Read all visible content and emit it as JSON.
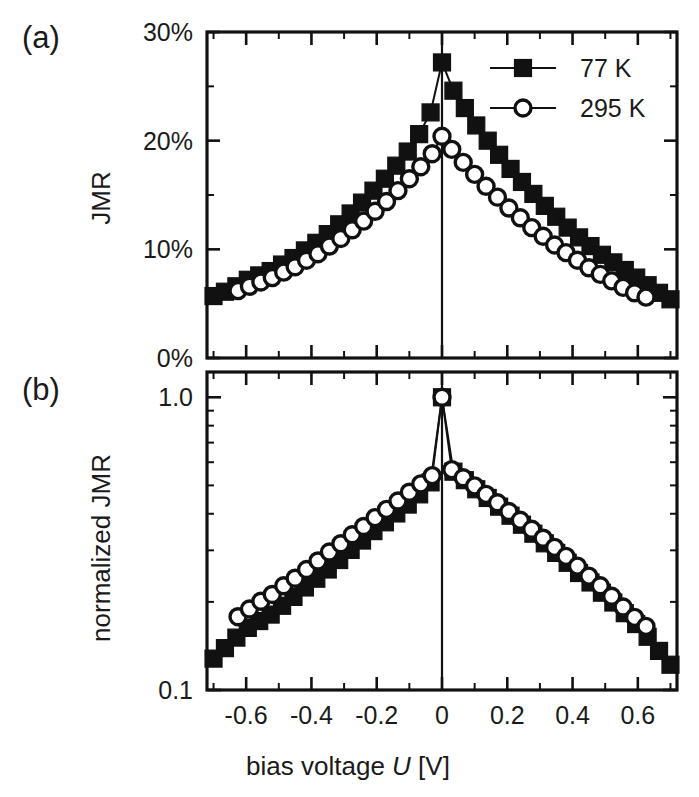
{
  "figure": {
    "panel_a_label": "(a)",
    "panel_b_label": "(b)",
    "xlabel_main": "bias voltage",
    "xlabel_symbol": "U",
    "xlabel_unit": "[V]",
    "ink_color": "#111111",
    "background_color": "#ffffff"
  },
  "legend": {
    "entries": [
      {
        "label": "77 K",
        "marker": "filled-square"
      },
      {
        "label": "295 K",
        "marker": "open-circle"
      }
    ]
  },
  "chart_data": [
    {
      "type": "line",
      "panel": "a",
      "title": "",
      "xlabel": "bias voltage U [V]",
      "ylabel": "JMR",
      "yscale": "linear",
      "xlim": [
        -0.72,
        0.72
      ],
      "ylim": [
        0,
        30
      ],
      "xticks": [
        -0.6,
        -0.4,
        -0.2,
        0,
        0.2,
        0.4,
        0.6
      ],
      "xticklabels": [
        "-0.6",
        "-0.4",
        "-0.2",
        "0",
        "0.2",
        "0.4",
        "0.6"
      ],
      "xminor_step": 0.1,
      "yticks": [
        0,
        10,
        20,
        30
      ],
      "yticklabels": [
        "0%",
        "10%",
        "20%",
        "30%"
      ],
      "yminor_step": 5,
      "grid": false,
      "legend_position": "top-right",
      "zero_line": true,
      "series": [
        {
          "name": "77 K",
          "marker": "filled-square",
          "x": [
            -0.7,
            -0.665,
            -0.63,
            -0.595,
            -0.56,
            -0.525,
            -0.49,
            -0.455,
            -0.42,
            -0.385,
            -0.35,
            -0.315,
            -0.28,
            -0.245,
            -0.21,
            -0.175,
            -0.14,
            -0.105,
            -0.07,
            -0.035,
            0.0,
            0.035,
            0.07,
            0.105,
            0.14,
            0.175,
            0.21,
            0.245,
            0.28,
            0.315,
            0.35,
            0.385,
            0.42,
            0.455,
            0.49,
            0.525,
            0.56,
            0.595,
            0.63,
            0.665,
            0.7
          ],
          "y": [
            5.7,
            6.1,
            6.6,
            7.2,
            7.6,
            8.0,
            8.6,
            9.2,
            9.9,
            10.6,
            11.4,
            12.3,
            13.3,
            14.3,
            15.4,
            16.5,
            17.7,
            19.0,
            20.6,
            22.6,
            27.2,
            24.6,
            23.0,
            21.4,
            20.0,
            18.7,
            17.4,
            16.2,
            15.1,
            14.0,
            13.0,
            12.0,
            11.1,
            10.3,
            9.5,
            8.8,
            8.1,
            7.4,
            6.7,
            6.0,
            5.4
          ]
        },
        {
          "name": "295 K",
          "marker": "open-circle",
          "x": [
            -0.625,
            -0.59,
            -0.555,
            -0.52,
            -0.485,
            -0.45,
            -0.415,
            -0.38,
            -0.345,
            -0.31,
            -0.275,
            -0.24,
            -0.205,
            -0.17,
            -0.135,
            -0.1,
            -0.065,
            -0.03,
            0.0,
            0.03,
            0.065,
            0.1,
            0.135,
            0.17,
            0.205,
            0.24,
            0.275,
            0.31,
            0.345,
            0.38,
            0.415,
            0.45,
            0.485,
            0.52,
            0.555,
            0.59,
            0.625
          ],
          "y": [
            6.2,
            6.6,
            7.0,
            7.4,
            7.9,
            8.4,
            9.0,
            9.6,
            10.3,
            11.0,
            11.8,
            12.6,
            13.5,
            14.4,
            15.4,
            16.5,
            17.6,
            18.8,
            20.4,
            19.2,
            18.0,
            16.9,
            15.8,
            14.8,
            13.8,
            12.9,
            12.0,
            11.2,
            10.4,
            9.7,
            9.0,
            8.3,
            7.7,
            7.1,
            6.5,
            6.0,
            5.6
          ]
        }
      ]
    },
    {
      "type": "line",
      "panel": "b",
      "title": "",
      "xlabel": "bias voltage U [V]",
      "ylabel": "normalized JMR",
      "yscale": "log",
      "xlim": [
        -0.72,
        0.72
      ],
      "ylim": [
        0.1,
        1.22
      ],
      "xticks": [
        -0.6,
        -0.4,
        -0.2,
        0,
        0.2,
        0.4,
        0.6
      ],
      "xticklabels": [
        "-0.6",
        "-0.4",
        "-0.2",
        "0",
        "0.2",
        "0.4",
        "0.6"
      ],
      "xminor_step": 0.1,
      "yticks": [
        0.1,
        1.0
      ],
      "yticklabels": [
        "0.1",
        "1.0"
      ],
      "grid": false,
      "legend_position": "none",
      "zero_line": true,
      "series": [
        {
          "name": "77 K",
          "marker": "filled-square",
          "x": [
            -0.7,
            -0.665,
            -0.63,
            -0.595,
            -0.56,
            -0.525,
            -0.49,
            -0.455,
            -0.42,
            -0.385,
            -0.35,
            -0.315,
            -0.28,
            -0.245,
            -0.21,
            -0.175,
            -0.14,
            -0.105,
            -0.07,
            -0.035,
            0.0,
            0.035,
            0.07,
            0.105,
            0.14,
            0.175,
            0.21,
            0.245,
            0.28,
            0.315,
            0.35,
            0.385,
            0.42,
            0.455,
            0.49,
            0.525,
            0.56,
            0.595,
            0.63,
            0.665,
            0.7
          ],
          "y": [
            0.128,
            0.139,
            0.151,
            0.163,
            0.172,
            0.181,
            0.194,
            0.208,
            0.224,
            0.24,
            0.258,
            0.278,
            0.301,
            0.324,
            0.349,
            0.374,
            0.401,
            0.43,
            0.466,
            0.512,
            1.0,
            0.557,
            0.521,
            0.485,
            0.453,
            0.423,
            0.394,
            0.367,
            0.342,
            0.317,
            0.294,
            0.272,
            0.251,
            0.233,
            0.215,
            0.199,
            0.183,
            0.168,
            0.152,
            0.136,
            0.122
          ]
        },
        {
          "name": "295 K",
          "marker": "open-circle",
          "x": [
            -0.625,
            -0.59,
            -0.555,
            -0.52,
            -0.485,
            -0.45,
            -0.415,
            -0.38,
            -0.345,
            -0.31,
            -0.275,
            -0.24,
            -0.205,
            -0.17,
            -0.135,
            -0.1,
            -0.065,
            -0.03,
            0.0,
            0.03,
            0.065,
            0.1,
            0.135,
            0.17,
            0.205,
            0.24,
            0.275,
            0.31,
            0.345,
            0.38,
            0.415,
            0.45,
            0.485,
            0.52,
            0.555,
            0.59,
            0.625
          ],
          "y": [
            0.178,
            0.189,
            0.201,
            0.212,
            0.227,
            0.241,
            0.258,
            0.276,
            0.296,
            0.316,
            0.339,
            0.362,
            0.388,
            0.414,
            0.442,
            0.474,
            0.506,
            0.54,
            1.0,
            0.566,
            0.531,
            0.498,
            0.466,
            0.436,
            0.407,
            0.38,
            0.354,
            0.33,
            0.307,
            0.286,
            0.265,
            0.245,
            0.227,
            0.209,
            0.192,
            0.177,
            0.165
          ]
        }
      ]
    }
  ]
}
